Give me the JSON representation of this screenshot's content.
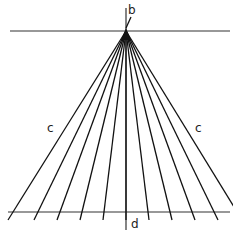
{
  "diagram": {
    "labels": {
      "top": "b",
      "left": "c",
      "right": "c",
      "bottom": "d"
    },
    "apex": {
      "x": 126,
      "y": 31
    },
    "top_line": {
      "x1": 10,
      "x2": 230,
      "y": 31
    },
    "bottom_line": {
      "x1": 8,
      "x2": 230,
      "y": 212
    },
    "vertical_line": {
      "x": 126,
      "y1": 6,
      "y2": 230
    },
    "fan_end_x": [
      8,
      34,
      57,
      80,
      103,
      126,
      149,
      172,
      195,
      218,
      242
    ],
    "fan_end_y": 220,
    "colors": {
      "stroke": "#111111",
      "background": "#ffffff"
    }
  }
}
